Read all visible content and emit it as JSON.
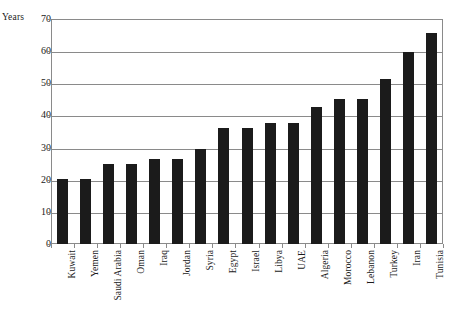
{
  "chart_data": {
    "type": "bar",
    "title": "",
    "xlabel": "",
    "ylabel": "Years",
    "ylim": [
      0,
      70
    ],
    "ytick_labels": [
      "70",
      "60",
      "50",
      "40",
      "30",
      "20",
      "10",
      "0"
    ],
    "yticks": [
      70,
      60,
      50,
      40,
      30,
      20,
      10,
      0
    ],
    "grid": "horizontal",
    "legend": "none",
    "bar_color": "#1b1b1b",
    "categories": [
      "Kuwait",
      "Yemen",
      "Saudi Arabia",
      "Oman",
      "Iraq",
      "Jordan",
      "Syria",
      "Egypt",
      "Israel",
      "Libya",
      "UAE",
      "Algeria",
      "Morocco",
      "Lebanon",
      "Turkey",
      "Iran",
      "Tunisia"
    ],
    "values": [
      20.3,
      20.3,
      25,
      24.8,
      26.5,
      26.5,
      29.7,
      36,
      36,
      37.5,
      37.5,
      42.5,
      45,
      45,
      51.3,
      59.8,
      65.5
    ]
  }
}
